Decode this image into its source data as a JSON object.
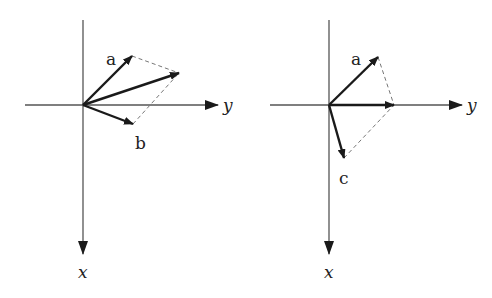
{
  "diagrams": [
    {
      "id": "left",
      "description": "Vector addition a + b",
      "axes": {
        "horizontal_label": "y",
        "vertical_label": "x"
      },
      "vectors": [
        {
          "label": "a",
          "role": "component"
        },
        {
          "label": "b",
          "role": "component"
        },
        {
          "label": "",
          "role": "resultant"
        }
      ],
      "labels": {
        "a": "a",
        "b": "b",
        "y": "y",
        "x": "x"
      }
    },
    {
      "id": "right",
      "description": "Vector addition a + c",
      "axes": {
        "horizontal_label": "y",
        "vertical_label": "x"
      },
      "vectors": [
        {
          "label": "a",
          "role": "component"
        },
        {
          "label": "c",
          "role": "component"
        },
        {
          "label": "",
          "role": "resultant (along y-axis)"
        }
      ],
      "labels": {
        "a": "a",
        "c": "c",
        "y": "y",
        "x": "x"
      }
    }
  ],
  "colors": {
    "axis": "#555555",
    "vector": "#1a1a1a",
    "dashed": "#777777"
  }
}
